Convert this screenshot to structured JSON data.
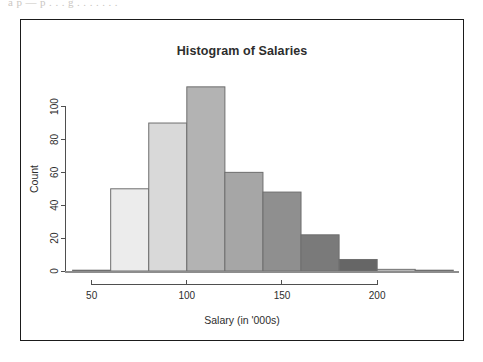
{
  "page": {
    "scan_artifact_text": "a  p   —  p   . . .  g  .  .  .   .  .  .   ."
  },
  "figure": {
    "title": "Histogram of Salaries",
    "x_axis_title": "Salary (in '000s)",
    "y_axis_title": "Count",
    "frame_border_color": "#1b1b1b",
    "background_color": "#ffffff",
    "axis_color": "#4f4f4f",
    "bar_border_color": "#6e6e6e"
  },
  "chart_data": {
    "type": "bar",
    "title": "Histogram of Salaries",
    "xlabel": "Salary (in '000s)",
    "ylabel": "Count",
    "grid": false,
    "legend": "none",
    "bin_width": 20,
    "bin_edges": [
      40,
      60,
      80,
      100,
      120,
      140,
      160,
      180,
      200,
      220,
      240
    ],
    "categories": [
      "40-60",
      "60-80",
      "80-100",
      "100-120",
      "120-140",
      "140-160",
      "160-180",
      "180-200",
      "200-220",
      "220-240"
    ],
    "bin_centers": [
      50,
      70,
      90,
      110,
      130,
      150,
      170,
      190,
      210,
      230
    ],
    "values": [
      0,
      50,
      90,
      112,
      60,
      48,
      22,
      7,
      1,
      0
    ],
    "bar_colors": [
      "#ffffff",
      "#ececec",
      "#d9d9d9",
      "#b3b3b3",
      "#a6a6a6",
      "#8f8f8f",
      "#7a7a7a",
      "#666666",
      "#ffffff",
      "#ffffff"
    ],
    "xlim": [
      36,
      243
    ],
    "ylim": [
      0,
      118
    ],
    "x_ticks": [
      50,
      100,
      150,
      200
    ],
    "x_tick_labels": [
      "50",
      "100",
      "150",
      "200"
    ],
    "y_ticks": [
      0,
      20,
      40,
      60,
      80,
      100
    ],
    "y_tick_labels": [
      "0",
      "20",
      "40",
      "60",
      "80",
      "100"
    ]
  }
}
